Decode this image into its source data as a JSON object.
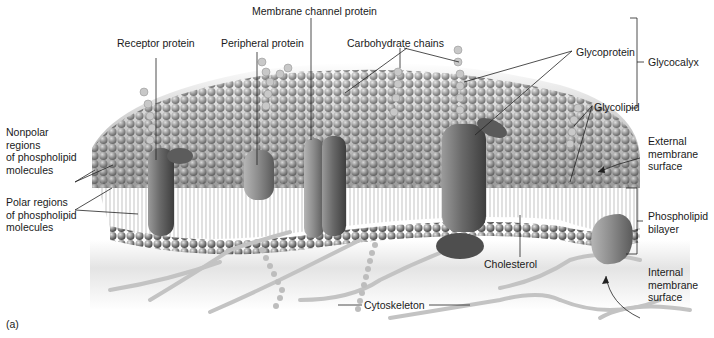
{
  "figure": {
    "panel_label": "(a)",
    "palette": {
      "background": "#ffffff",
      "membrane_head": "#8a8a8a",
      "membrane_head_highlight": "#d9d9d9",
      "protein": "#6e6e6e",
      "cytoskeleton": "#bdbdbd",
      "label_text": "#1a1a1a",
      "leader_line": "#222222"
    }
  },
  "labels": {
    "membrane_channel_protein": "Membrane channel protein",
    "receptor_protein": "Receptor protein",
    "peripheral_protein": "Peripheral protein",
    "carbohydrate_chains": "Carbohydrate chains",
    "glycoprotein": "Glycoprotein",
    "glycocalyx": "Glycocalyx",
    "glycolipid": "Glycolipid",
    "nonpolar": [
      "Nonpolar",
      "regions",
      "of phospholipid",
      "molecules"
    ],
    "polar": [
      "Polar regions",
      "of phospholipid",
      "molecules"
    ],
    "external_surface": [
      "External",
      "membrane",
      "surface"
    ],
    "phospholipid_bilayer": [
      "Phospholipid",
      "bilayer"
    ],
    "internal_surface": [
      "Internal",
      "membrane",
      "surface"
    ],
    "cholesterol": "Cholesterol",
    "cytoskeleton": "Cytoskeleton"
  }
}
